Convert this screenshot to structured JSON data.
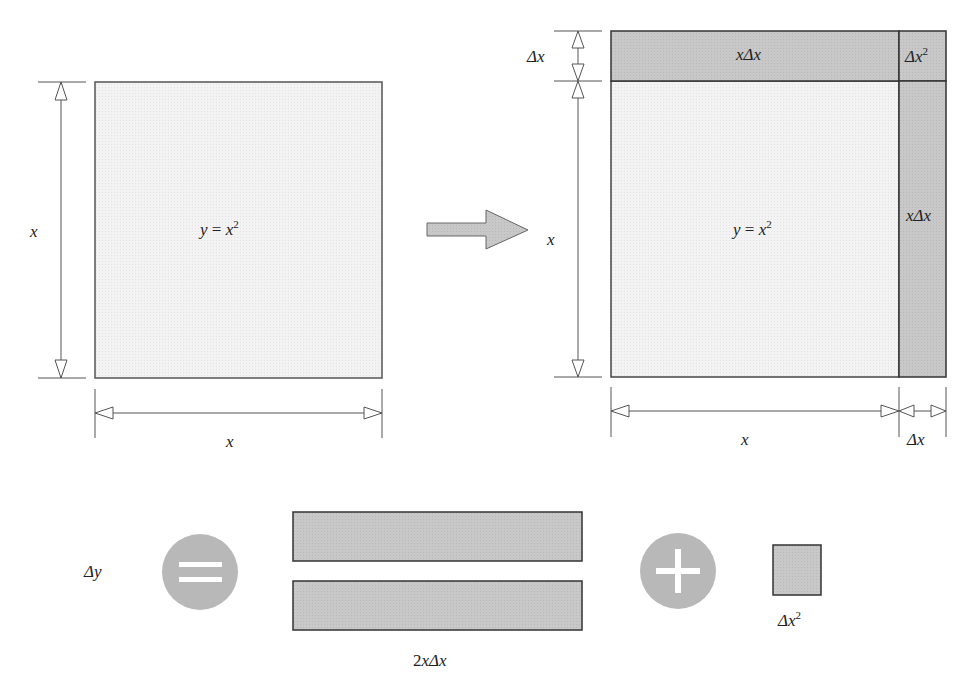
{
  "diagram": {
    "colors": {
      "light_fill": "#f2f2f2",
      "dark_fill": "#c6c6c6",
      "stroke": "#333333",
      "circle": "#b5b5b5",
      "arrow_fill": "#cccccc"
    },
    "top_cut_text": "",
    "left_square": {
      "center_label_y": "y",
      "center_label_eq": " = ",
      "center_label_x": "x",
      "center_label_sup": "2",
      "side_label": "x",
      "bottom_label": "x"
    },
    "right_square": {
      "top_strip_label_x": "x",
      "top_strip_label_delta": "Δx",
      "corner_label_delta": "Δx",
      "corner_label_sup": "2",
      "right_strip_label_x": "x",
      "right_strip_label_delta": "Δx",
      "center_label_y": "y",
      "center_label_eq": " = ",
      "center_label_x": "x",
      "center_label_sup": "2",
      "left_dim_top": "Δx",
      "left_dim_main": "x",
      "bottom_dim_main": "x",
      "bottom_dim_delta": "Δx"
    },
    "equation": {
      "lhs": "Δy",
      "equals_symbol": "=",
      "plus_symbol": "+",
      "rects_label_coef": "2",
      "rects_label_x": "x",
      "rects_label_delta": "Δx",
      "small_label_delta": "Δx",
      "small_label_sup": "2"
    }
  }
}
